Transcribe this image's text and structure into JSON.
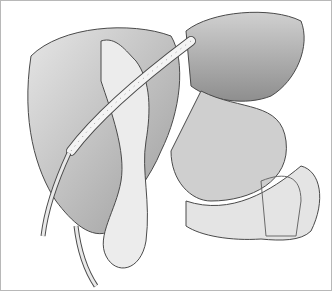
{
  "illustration": {
    "subject": "liver-surgery-anatomical-drawing",
    "colors": {
      "border": "#b8b8b8",
      "organ_fill": "#d6d6d6",
      "organ_shade": "#a8a8a8",
      "line": "#4a4a4a",
      "tissue_light": "#ececec"
    }
  }
}
